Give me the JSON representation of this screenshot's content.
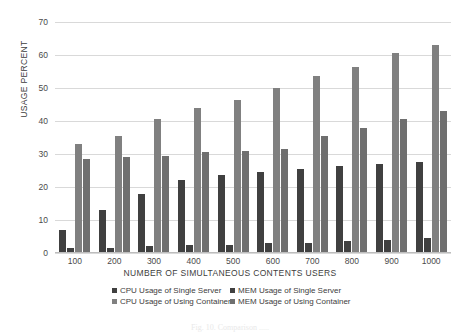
{
  "chart_data": {
    "type": "bar",
    "title": "",
    "xlabel": "NUMBER OF SIMULTANEOUS CONTENTS USERS",
    "ylabel": "USAGE PERCENT",
    "categories": [
      "100",
      "200",
      "300",
      "400",
      "500",
      "600",
      "700",
      "800",
      "900",
      "1000"
    ],
    "ylim": [
      0,
      70
    ],
    "yticks": [
      0,
      10,
      20,
      30,
      40,
      50,
      60,
      70
    ],
    "grid": "horizontal",
    "legend_position": "bottom",
    "series": [
      {
        "name": "CPU Usage of Single Server",
        "color": "#404040",
        "values": [
          7,
          13,
          18,
          22,
          23.5,
          24.5,
          25.5,
          26.5,
          27,
          27.5
        ]
      },
      {
        "name": "MEM Usage of Single Server",
        "color": "#404040",
        "values": [
          1.5,
          1.5,
          2,
          2.5,
          2.5,
          3,
          3,
          3.5,
          4,
          4.5
        ]
      },
      {
        "name": "CPU Usage of Using Container",
        "color": "#808080",
        "values": [
          33,
          35.5,
          40.5,
          44,
          46.5,
          50,
          53.5,
          56.5,
          60.5,
          63
        ]
      },
      {
        "name": "MEM Usage of Using Container",
        "color": "#6f6f6f",
        "values": [
          28.5,
          29,
          29.5,
          30.5,
          31,
          31.5,
          35.5,
          38,
          40.5,
          43
        ]
      }
    ]
  },
  "legend": {
    "rows": [
      [
        "CPU Usage of Single Server",
        "MEM Usage of Single Server"
      ],
      [
        "CPU Usage of Using Container",
        "MEM Usage of Using Container"
      ]
    ]
  },
  "caption": {
    "text": "Fig. 10. Comparison ....."
  },
  "colors": {
    "single_server": "#404040",
    "container_cpu": "#808080",
    "container_mem": "#6f6f6f",
    "gridline": "#d9d9d9",
    "axis_text": "#4a4a4a"
  }
}
